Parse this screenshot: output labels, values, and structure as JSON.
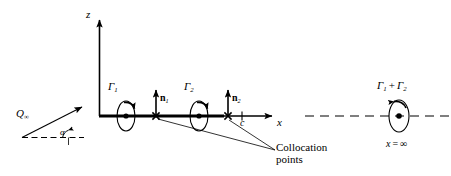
{
  "figure": {
    "background_color": "#ffffff",
    "stroke_color": "#000000"
  },
  "axes": {
    "z_label": "z",
    "x_label": "x",
    "origin_label": "",
    "chord_label": "c"
  },
  "freestream": {
    "velocity_label": "Q",
    "velocity_subscript": "∞",
    "angle_label": "α"
  },
  "vortices": [
    {
      "label": "Γ",
      "subscript": "1",
      "name": "gamma-1"
    },
    {
      "label": "Γ",
      "subscript": "2",
      "name": "gamma-2"
    }
  ],
  "normals": [
    {
      "label": "n",
      "subscript": "1",
      "name": "normal-1"
    },
    {
      "label": "n",
      "subscript": "2",
      "name": "normal-2"
    }
  ],
  "collocation": {
    "line1": "Collocation",
    "line2": "points"
  },
  "wake": {
    "circulation_label": "Γ₁ + Γ₂",
    "gamma": "Γ",
    "sub1": "1",
    "plus": "+",
    "sub2": "2",
    "position_label": "x = ∞",
    "position_var": "x",
    "equals": "=",
    "infinity": "∞"
  }
}
